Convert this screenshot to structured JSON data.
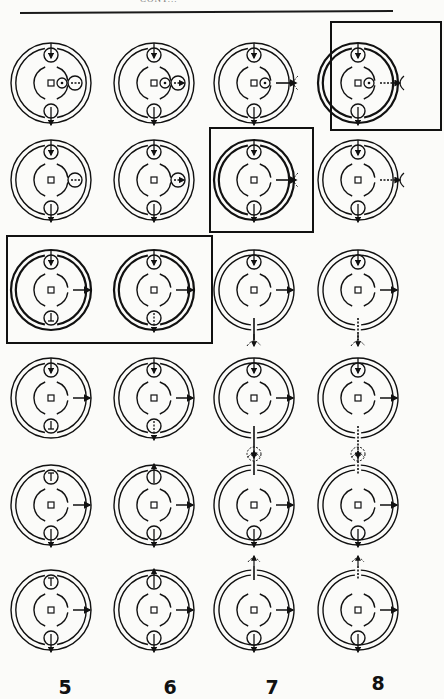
{
  "header": {
    "running_head": "CONT..."
  },
  "columns": [
    {
      "label": "5",
      "x": 65
    },
    {
      "label": "6",
      "x": 170
    },
    {
      "label": "7",
      "x": 272
    },
    {
      "label": "8",
      "x": 378
    }
  ],
  "rows_y": [
    83,
    180,
    290,
    398,
    505,
    610
  ],
  "highlight_boxes": [
    {
      "x": 331,
      "y": 22,
      "w": 110,
      "h": 108
    },
    {
      "x": 210,
      "y": 128,
      "w": 103,
      "h": 104
    },
    {
      "x": 7,
      "y": 236,
      "w": 205,
      "h": 107
    }
  ],
  "diagrams": [
    {
      "row": 0,
      "col": 0,
      "thick": false,
      "top": "in",
      "bottom": "out",
      "side": "bud-dot",
      "gapBottom": false
    },
    {
      "row": 0,
      "col": 1,
      "thick": false,
      "top": "in",
      "bottom": "out",
      "side": "bud-dot-dotted",
      "gapBottom": false
    },
    {
      "row": 0,
      "col": 2,
      "thick": false,
      "top": "in",
      "bottom": "out",
      "side": "dot-arrow-arc",
      "gapBottom": false
    },
    {
      "row": 0,
      "col": 3,
      "thick": true,
      "top": "in",
      "bottom": "out",
      "side": "dot-dotted-arc",
      "gapBottom": false
    },
    {
      "row": 1,
      "col": 0,
      "thick": false,
      "top": "in",
      "bottom": "out",
      "side": "bud",
      "gapBottom": false
    },
    {
      "row": 1,
      "col": 1,
      "thick": false,
      "top": "in",
      "bottom": "out",
      "side": "bud-dotted",
      "gapBottom": false
    },
    {
      "row": 1,
      "col": 2,
      "thick": true,
      "top": "in",
      "bottom": "out",
      "side": "arrow-arc",
      "gapBottom": false
    },
    {
      "row": 1,
      "col": 3,
      "thick": false,
      "top": "in",
      "bottom": "out",
      "side": "dotted-arc",
      "gapBottom": false
    },
    {
      "row": 2,
      "col": 0,
      "thick": true,
      "top": "in",
      "bottom": "stop",
      "side": "arrow",
      "gapBottom": false
    },
    {
      "row": 2,
      "col": 1,
      "thick": true,
      "top": "in",
      "bottom": "dotted",
      "side": "arrow",
      "gapBottom": false
    },
    {
      "row": 2,
      "col": 2,
      "thick": false,
      "top": "in",
      "bottom": "none",
      "side": "arrow",
      "gapBottom": true,
      "below": "solid-arc"
    },
    {
      "row": 2,
      "col": 3,
      "thick": false,
      "top": "in",
      "bottom": "none",
      "side": "arrow",
      "gapBottom": true,
      "below": "dotted-arc"
    },
    {
      "row": 3,
      "col": 0,
      "thick": false,
      "top": "in",
      "bottom": "stop",
      "side": "arrow",
      "gapBottom": false
    },
    {
      "row": 3,
      "col": 1,
      "thick": false,
      "top": "in",
      "bottom": "dotted",
      "side": "arrow",
      "gapBottom": false
    },
    {
      "row": 3,
      "col": 2,
      "thick": false,
      "top": "in",
      "bottom": "none",
      "side": "arrow",
      "gapBottom": true,
      "below": "solid-circle"
    },
    {
      "row": 3,
      "col": 3,
      "thick": false,
      "top": "in",
      "bottom": "none",
      "side": "arrow",
      "gapBottom": true,
      "below": "dotted-circle"
    },
    {
      "row": 4,
      "col": 0,
      "thick": false,
      "top": "stop",
      "bottom": "out",
      "side": "arrow",
      "gapBottom": false
    },
    {
      "row": 4,
      "col": 1,
      "thick": false,
      "top": "up",
      "bottom": "out",
      "side": "arrow",
      "gapBottom": false
    },
    {
      "row": 4,
      "col": 2,
      "thick": false,
      "top": "none",
      "bottom": "out",
      "side": "arrow",
      "gapTop": true,
      "above": "solid-arc"
    },
    {
      "row": 4,
      "col": 3,
      "thick": false,
      "top": "none",
      "bottom": "out",
      "side": "arrow",
      "gapTop": true,
      "above": "dotted-arc"
    },
    {
      "row": 5,
      "col": 0,
      "thick": false,
      "top": "stop",
      "bottom": "out",
      "side": "arrow",
      "gapBottom": false
    },
    {
      "row": 5,
      "col": 1,
      "thick": false,
      "top": "up",
      "bottom": "out",
      "side": "arrow",
      "gapBottom": false
    },
    {
      "row": 5,
      "col": 2,
      "thick": false,
      "top": "none",
      "bottom": "out",
      "side": "arrow",
      "gapTop": true,
      "above": "solid-arc"
    },
    {
      "row": 5,
      "col": 3,
      "thick": false,
      "top": "none",
      "bottom": "out",
      "side": "arrow",
      "gapTop": true,
      "above": "dotted-arc"
    }
  ]
}
